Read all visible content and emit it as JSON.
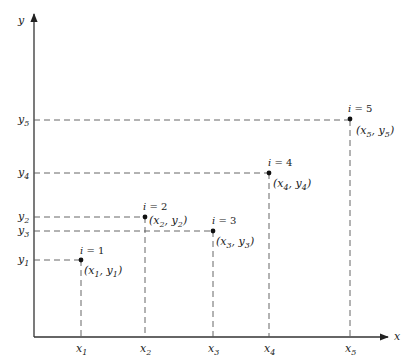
{
  "diagram": {
    "axes": {
      "x_label": "x",
      "y_label": "y"
    },
    "points": [
      {
        "index_label": "i = 1",
        "i": "i",
        "eq": " = 1",
        "coord_label": "(x1, y1)",
        "x_tick": "x",
        "x_sub": "1",
        "y_tick": "y",
        "y_sub": "1",
        "n": "1"
      },
      {
        "index_label": "i = 2",
        "i": "i",
        "eq": " = 2",
        "coord_label": "(x2, y2)",
        "x_tick": "x",
        "x_sub": "2",
        "y_tick": "y",
        "y_sub": "2",
        "n": "2"
      },
      {
        "index_label": "i = 3",
        "i": "i",
        "eq": " = 3",
        "coord_label": "(x3, y3)",
        "x_tick": "x",
        "x_sub": "3",
        "y_tick": "y",
        "y_sub": "3",
        "n": "3"
      },
      {
        "index_label": "i = 4",
        "i": "i",
        "eq": " = 4",
        "coord_label": "(x4, y4)",
        "x_tick": "x",
        "x_sub": "4",
        "y_tick": "y",
        "y_sub": "4",
        "n": "4"
      },
      {
        "index_label": "i = 5",
        "i": "i",
        "eq": " = 5",
        "coord_label": "(x5, y5)",
        "x_tick": "x",
        "x_sub": "5",
        "y_tick": "y",
        "y_sub": "5",
        "n": "5"
      }
    ],
    "colors": {
      "line": "#333333",
      "dash": "#555555",
      "point": "#111111"
    }
  }
}
